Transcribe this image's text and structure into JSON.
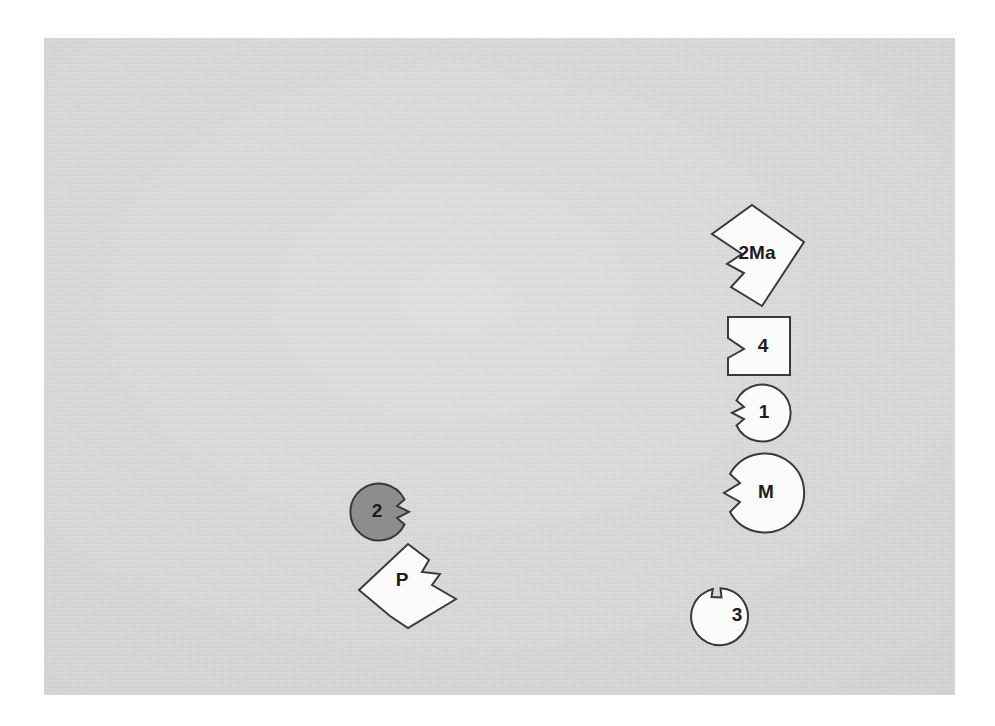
{
  "figure": {
    "background_color": "#ffffff",
    "plate_color": "#d3d3d3",
    "outline_color": "#3a3a3a",
    "shape_fill_white": "#fbfbfb",
    "shape_fill_gray": "#8d8d8d",
    "label_color": "#1c1c1c",
    "plate": {
      "x": 44,
      "y": 38,
      "width": 911,
      "height": 657
    }
  },
  "shapes": [
    {
      "id": "shape-2ma",
      "label": "2Ma",
      "form": "rotated-polygon",
      "fill": "white",
      "notch": "left-v-notch",
      "center": {
        "x": 753,
        "y": 252
      },
      "bbox": {
        "x": 709,
        "y": 205,
        "width": 92,
        "height": 100
      }
    },
    {
      "id": "shape-4",
      "label": "4",
      "form": "square",
      "fill": "white",
      "notch": "left-v-notch",
      "center": {
        "x": 758,
        "y": 345
      },
      "bbox": {
        "x": 727,
        "y": 316,
        "width": 62,
        "height": 58
      }
    },
    {
      "id": "shape-1",
      "label": "1",
      "form": "circle",
      "fill": "white",
      "notch": "left-v-notch",
      "center": {
        "x": 760,
        "y": 412
      },
      "bbox": {
        "x": 731,
        "y": 384,
        "width": 57,
        "height": 57
      }
    },
    {
      "id": "shape-m",
      "label": "M",
      "form": "circle",
      "fill": "white",
      "notch": "left-v-notch",
      "center": {
        "x": 761,
        "y": 491
      },
      "bbox": {
        "x": 721,
        "y": 453,
        "width": 79,
        "height": 79
      }
    },
    {
      "id": "shape-3",
      "label": "3",
      "form": "circle",
      "fill": "white",
      "notch": "top-left-step-notch",
      "center": {
        "x": 735,
        "y": 611
      },
      "bbox": {
        "x": 706,
        "y": 583,
        "width": 57,
        "height": 57
      }
    },
    {
      "id": "shape-2",
      "label": "2",
      "form": "circle",
      "fill": "gray",
      "notch": "right-v-notch",
      "center": {
        "x": 380,
        "y": 511
      },
      "bbox": {
        "x": 352,
        "y": 483,
        "width": 57,
        "height": 57
      }
    },
    {
      "id": "shape-p",
      "label": "P",
      "form": "rotated-polygon",
      "fill": "white",
      "notch": "right-step-tab",
      "center": {
        "x": 403,
        "y": 578
      },
      "bbox": {
        "x": 358,
        "y": 539,
        "width": 100,
        "height": 88
      }
    }
  ]
}
